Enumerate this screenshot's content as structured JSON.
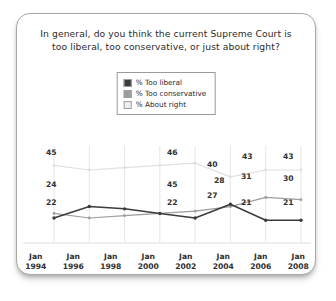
{
  "card": {
    "title_line1": "In general, do you think the current Supreme Court is",
    "title_line2": "too liberal, too conservative, or just about right?"
  },
  "legend": {
    "items": [
      {
        "label": "% Too liberal",
        "color": "#3b3b3b",
        "name": "legend-too-liberal"
      },
      {
        "label": "% Too conservative",
        "color": "#9d9d9d",
        "name": "legend-too-conservative"
      },
      {
        "label": "% About right",
        "color": "#e2e2e2",
        "name": "legend-about-right"
      }
    ]
  },
  "chart_data": {
    "type": "line",
    "title": "In general, do you think the current Supreme Court is too liberal, too conservative, or just about right?",
    "xlabel": "",
    "ylabel": "",
    "categories": [
      "Jan 1994",
      "Jan 1996",
      "Jan 1998",
      "Jan 2000",
      "Jan 2002",
      "Jan 2004",
      "Jan 2006",
      "Jan 2008"
    ],
    "ylim": [
      15,
      50
    ],
    "grid": true,
    "legend_position": "top-center",
    "series": [
      {
        "name": "% Too liberal",
        "color": "#3b3b3b",
        "values": [
          22,
          27,
          26,
          24,
          22,
          28,
          21,
          21
        ],
        "labels": [
          "22",
          "",
          "",
          "",
          "",
          "28",
          "21",
          "21"
        ]
      },
      {
        "name": "% Too conservative",
        "color": "#9d9d9d",
        "values": [
          24,
          22,
          23,
          24,
          25,
          27,
          31,
          30
        ],
        "labels": [
          "24",
          "",
          "",
          "",
          "45",
          "27",
          "31",
          "30"
        ]
      },
      {
        "name": "% About right",
        "color": "#e0e0e0",
        "values": [
          45,
          43,
          44,
          45,
          46,
          40,
          43,
          43
        ],
        "labels": [
          "45",
          "",
          "",
          "",
          "46",
          "40",
          "43",
          "43"
        ]
      }
    ]
  },
  "xaxis": {
    "ticks": [
      {
        "month": "Jan",
        "year": "1994"
      },
      {
        "month": "Jan",
        "year": "1996"
      },
      {
        "month": "Jan",
        "year": "1998"
      },
      {
        "month": "Jan",
        "year": "2000"
      },
      {
        "month": "Jan",
        "year": "2002"
      },
      {
        "month": "Jan",
        "year": "2004"
      },
      {
        "month": "Jan",
        "year": "2006"
      },
      {
        "month": "Jan",
        "year": "2008"
      }
    ]
  },
  "data_labels": [
    {
      "text": "45",
      "x": 29,
      "y": 2,
      "name": "label-about-right-1994"
    },
    {
      "text": "24",
      "x": 29,
      "y": 34,
      "name": "label-too-conservative-1994"
    },
    {
      "text": "22",
      "x": 29,
      "y": 52,
      "name": "label-too-liberal-1994"
    },
    {
      "text": "46",
      "x": 150,
      "y": 2,
      "name": "label-about-right-2002"
    },
    {
      "text": "45",
      "x": 150,
      "y": 34,
      "name": "label-too-conservative-2002"
    },
    {
      "text": "22",
      "x": 150,
      "y": 52,
      "name": "label-too-liberal-2002"
    },
    {
      "text": "40",
      "x": 190,
      "y": 14,
      "name": "label-about-right-2004"
    },
    {
      "text": "28",
      "x": 197,
      "y": 30,
      "name": "label-too-liberal-2004"
    },
    {
      "text": "27",
      "x": 190,
      "y": 45,
      "name": "label-too-conservative-2004"
    },
    {
      "text": "43",
      "x": 225,
      "y": 6,
      "name": "label-about-right-2006"
    },
    {
      "text": "31",
      "x": 224,
      "y": 26,
      "name": "label-too-conservative-2006"
    },
    {
      "text": "21",
      "x": 224,
      "y": 52,
      "name": "label-too-liberal-2006"
    },
    {
      "text": "43",
      "x": 266,
      "y": 6,
      "name": "label-about-right-2008"
    },
    {
      "text": "30",
      "x": 266,
      "y": 28,
      "name": "label-too-conservative-2008"
    },
    {
      "text": "21",
      "x": 266,
      "y": 52,
      "name": "label-too-liberal-2008"
    }
  ]
}
